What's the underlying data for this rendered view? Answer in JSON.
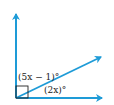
{
  "diagram": {
    "type": "angle-diagram",
    "colors": {
      "ray": "#1e9bd7",
      "text": "#222222",
      "background": "#ffffff"
    },
    "labels": {
      "upper_angle": "(5x − 1)°",
      "lower_angle": "(2x)°"
    },
    "right_angle_marker": true,
    "rays": [
      "vertical-ray",
      "diagonal-ray",
      "horizontal-ray"
    ]
  }
}
